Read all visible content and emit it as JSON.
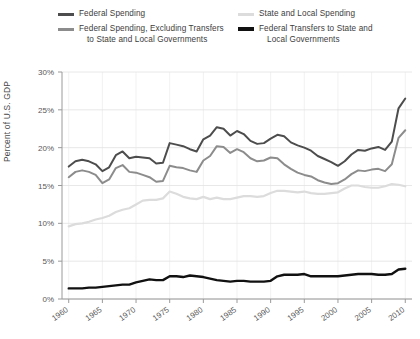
{
  "legend": {
    "columns": [
      {
        "items": [
          {
            "name": "federal-spending",
            "color": "#4d4d4d",
            "width": 3,
            "lines": [
              "Federal Spending"
            ]
          },
          {
            "name": "federal-spending-excluding-transfers",
            "color": "#8c8c8c",
            "width": 3,
            "lines": [
              "Federal Spending, Excluding Transfers",
              "to State and Local Governments"
            ]
          }
        ]
      },
      {
        "items": [
          {
            "name": "state-and-local-spending",
            "color": "#dcdcdc",
            "width": 3,
            "lines": [
              "State and Local Spending"
            ]
          },
          {
            "name": "federal-transfers-to-state-and-local",
            "color": "#111111",
            "width": 4,
            "lines": [
              "Federal Transfers to State and",
              "Local Governments"
            ]
          }
        ]
      }
    ]
  },
  "axes": {
    "ylabel": "Percent of U.S. GDP",
    "yticks": [
      "0%",
      "5%",
      "10%",
      "15%",
      "20%",
      "25%",
      "30%"
    ],
    "xticks": [
      "1960",
      "1965",
      "1970",
      "1975",
      "1980",
      "1985",
      "1990",
      "1995",
      "2000",
      "2005",
      "2010"
    ]
  },
  "chart_data": {
    "type": "line",
    "title": "",
    "xlabel": "",
    "ylabel": "Percent of U.S. GDP",
    "xlim": [
      1959,
      2011
    ],
    "ylim": [
      0,
      30
    ],
    "ytick_values": [
      0,
      5,
      10,
      15,
      20,
      25,
      30
    ],
    "xtick_values": [
      1960,
      1965,
      1970,
      1975,
      1980,
      1985,
      1990,
      1995,
      2000,
      2005,
      2010
    ],
    "grid": "horizontal-and-vertical-light",
    "legend_position": "above-plot-two-columns",
    "x": [
      1960,
      1961,
      1962,
      1963,
      1964,
      1965,
      1966,
      1967,
      1968,
      1969,
      1970,
      1971,
      1972,
      1973,
      1974,
      1975,
      1976,
      1977,
      1978,
      1979,
      1980,
      1981,
      1982,
      1983,
      1984,
      1985,
      1986,
      1987,
      1988,
      1989,
      1990,
      1991,
      1992,
      1993,
      1994,
      1995,
      1996,
      1997,
      1998,
      1999,
      2000,
      2001,
      2002,
      2003,
      2004,
      2005,
      2006,
      2007,
      2008,
      2009,
      2010
    ],
    "series": [
      {
        "name": "Federal Spending",
        "color": "#4d4d4d",
        "width": 2.0,
        "values": [
          17.5,
          18.2,
          18.4,
          18.2,
          17.8,
          16.9,
          17.4,
          19.0,
          19.5,
          18.6,
          18.8,
          18.7,
          18.6,
          17.9,
          18.0,
          20.6,
          20.4,
          20.2,
          19.8,
          19.5,
          21.1,
          21.6,
          22.7,
          22.5,
          21.6,
          22.2,
          21.8,
          20.9,
          20.5,
          20.6,
          21.2,
          21.7,
          21.5,
          20.7,
          20.3,
          20.0,
          19.6,
          18.9,
          18.5,
          18.1,
          17.6,
          18.2,
          19.1,
          19.7,
          19.6,
          19.9,
          20.1,
          19.7,
          20.8,
          25.2,
          26.5
        ],
        "note": "2009-2010 peak just over 26%, end value ~26.5%"
      },
      {
        "name": "Federal Spending, Excluding Transfers to State and Local Governments",
        "color": "#8c8c8c",
        "width": 2.0,
        "values": [
          16.1,
          16.8,
          17.0,
          16.8,
          16.4,
          15.3,
          15.8,
          17.3,
          17.7,
          16.8,
          16.7,
          16.4,
          16.1,
          15.5,
          15.6,
          17.6,
          17.4,
          17.3,
          17.0,
          16.8,
          18.3,
          18.9,
          20.2,
          20.1,
          19.3,
          19.8,
          19.4,
          18.6,
          18.2,
          18.3,
          18.7,
          18.6,
          17.8,
          17.2,
          16.7,
          16.4,
          16.2,
          15.7,
          15.4,
          15.2,
          15.3,
          15.8,
          16.5,
          17.0,
          16.9,
          17.1,
          17.2,
          16.9,
          17.8,
          21.3,
          22.3
        ],
        "note": "dips to ~15.2% around 1999-2000, ends ~22.3%"
      },
      {
        "name": "State and Local Spending",
        "color": "#dcdcdc",
        "width": 2.2,
        "values": [
          9.6,
          9.9,
          10.0,
          10.2,
          10.5,
          10.7,
          11.0,
          11.5,
          11.8,
          12.0,
          12.5,
          13.0,
          13.1,
          13.1,
          13.3,
          14.2,
          13.9,
          13.5,
          13.3,
          13.2,
          13.5,
          13.2,
          13.4,
          13.2,
          13.2,
          13.4,
          13.6,
          13.6,
          13.5,
          13.6,
          14.0,
          14.3,
          14.3,
          14.2,
          14.1,
          14.2,
          14.0,
          13.9,
          13.9,
          14.0,
          14.1,
          14.6,
          15.0,
          15.0,
          14.8,
          14.7,
          14.7,
          14.9,
          15.2,
          15.1,
          14.9
        ],
        "note": "peak ~14.2% in 1975, flat band 13-15% thereafter"
      },
      {
        "name": "Federal Transfers to State and Local Governments",
        "color": "#111111",
        "width": 2.4,
        "values": [
          1.4,
          1.4,
          1.4,
          1.5,
          1.5,
          1.6,
          1.7,
          1.8,
          1.9,
          1.9,
          2.2,
          2.4,
          2.6,
          2.5,
          2.5,
          3.0,
          3.0,
          2.9,
          3.1,
          3.0,
          2.9,
          2.7,
          2.5,
          2.4,
          2.3,
          2.4,
          2.4,
          2.3,
          2.3,
          2.3,
          2.4,
          3.0,
          3.2,
          3.2,
          3.2,
          3.3,
          3.0,
          3.0,
          3.0,
          3.0,
          3.0,
          3.1,
          3.2,
          3.3,
          3.3,
          3.3,
          3.2,
          3.2,
          3.3,
          3.9,
          4.0
        ],
        "note": "rises from ~1.4% to ~4%"
      }
    ]
  }
}
